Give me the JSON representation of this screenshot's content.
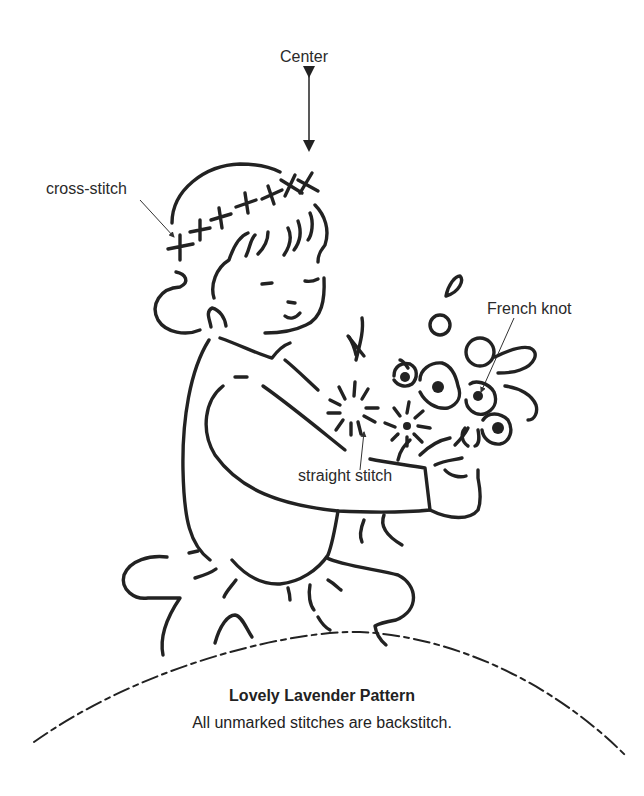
{
  "labels": {
    "center": "Center",
    "cross_stitch": "cross-stitch",
    "french_knot": "French knot",
    "straight_stitch": "straight stitch"
  },
  "caption": {
    "title": "Lovely Lavender Pattern",
    "subtitle": "All unmarked stitches are backstitch."
  },
  "colors": {
    "line": "#222222",
    "background": "#ffffff"
  }
}
